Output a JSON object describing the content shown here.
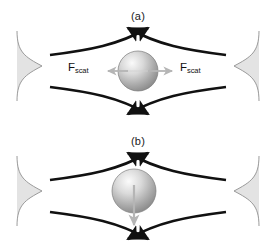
{
  "figure": {
    "name": "optical-trapping-forces-figure",
    "background_color": "#ffffff",
    "width": 276,
    "height": 249,
    "beam_color": "#111111",
    "gaussian_fill_color": "#e0e0e0",
    "gaussian_stroke_color": "#8c8c8c",
    "force_arrow_color": "#b5b5b5",
    "bead_light_color": "#f2f2f2",
    "bead_dark_color": "#8f8f8f"
  },
  "panels": [
    {
      "id": "a",
      "caption": "(a)",
      "description": "Dual-beam trap with bead centered on the optical axis; scattering forces balanced left and right",
      "bead": {
        "center_x": 138,
        "center_y": 71,
        "radius": 20
      },
      "force_labels": [
        {
          "symbol": "F",
          "subscript": "scat",
          "direction": "left"
        },
        {
          "symbol": "F",
          "subscript": "scat",
          "direction": "right"
        }
      ]
    },
    {
      "id": "b",
      "caption": "(b)",
      "description": "Dual-beam trap with bead displaced above the optical axis; net gradient force points downward",
      "bead": {
        "center_x": 134,
        "center_y": 66,
        "radius": 22
      },
      "force_labels": [
        {
          "symbol": "F",
          "subscript": "grad",
          "direction": "down"
        }
      ]
    }
  ],
  "labels": {
    "caption_a": "(a)",
    "caption_b": "(b)",
    "fscat_symbol": "F",
    "fscat_subscript": "scat",
    "fgrad_symbol": "F",
    "fgrad_subscript": "grad"
  }
}
